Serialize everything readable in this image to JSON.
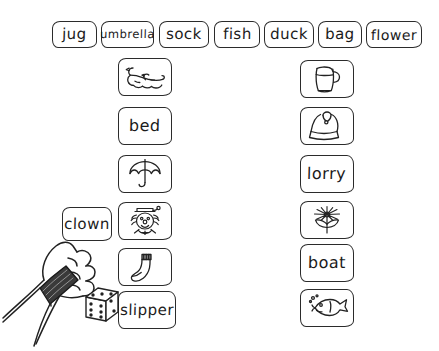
{
  "worksheet": {
    "title": "Word and picture matching worksheet",
    "background_color": "#ffffff",
    "ink_color": "#2b2b2b"
  },
  "word_bank": {
    "name": "top-word-row",
    "cards": [
      {
        "label": "jug",
        "x": 52,
        "width": 45
      },
      {
        "label": "umbrella",
        "x": 101,
        "width": 53
      },
      {
        "label": "sock",
        "x": 159,
        "width": 50
      },
      {
        "label": "fish",
        "x": 214,
        "width": 46
      },
      {
        "label": "duck",
        "x": 264,
        "width": 50
      },
      {
        "label": "bag",
        "x": 318,
        "width": 44
      },
      {
        "label": "flower",
        "x": 366,
        "width": 56
      }
    ]
  },
  "left_column": {
    "name": "left-card-column",
    "x": 118,
    "cards": [
      {
        "type": "picture",
        "icon": "duck-icon",
        "label": "duck",
        "y": 58
      },
      {
        "type": "word",
        "icon": "",
        "label": "bed",
        "y": 107,
        "stacked": true
      },
      {
        "type": "picture",
        "icon": "umbrella-icon",
        "label": "umbrella",
        "y": 155
      },
      {
        "type": "picture",
        "icon": "clown-icon",
        "label": "clown",
        "y": 202
      },
      {
        "type": "picture",
        "icon": "sock-icon",
        "label": "sock",
        "y": 248
      },
      {
        "type": "word",
        "icon": "",
        "label": "slipper",
        "y": 291,
        "stacked": true
      }
    ]
  },
  "right_column": {
    "name": "right-card-column",
    "x": 300,
    "cards": [
      {
        "type": "picture",
        "icon": "jug-icon",
        "label": "jug",
        "y": 60
      },
      {
        "type": "word",
        "icon": "",
        "label": "lorry",
        "y": 155,
        "stacked": true
      },
      {
        "type": "picture",
        "icon": "bag-icon",
        "label": "bag",
        "y": 107
      },
      {
        "type": "picture",
        "icon": "flower-icon",
        "label": "flower",
        "y": 201
      },
      {
        "type": "word",
        "icon": "",
        "label": "boat",
        "y": 244,
        "stacked": true
      },
      {
        "type": "picture",
        "icon": "fish-icon",
        "label": "fish",
        "y": 289
      }
    ]
  },
  "hand": {
    "name": "hand-holding-card",
    "held_card_label": "clown",
    "wristwatch": "wristwatch-icon"
  },
  "die": {
    "name": "die-icon",
    "front_face_value": 6,
    "top_face_value": 3,
    "left_face_value": 2
  }
}
